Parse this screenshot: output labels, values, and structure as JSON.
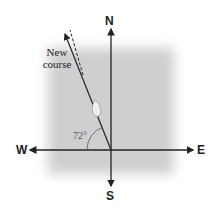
{
  "compass": {
    "north": "N",
    "south": "S",
    "east": "E",
    "west": "W"
  },
  "course": {
    "label_line1": "New",
    "label_line2": "course",
    "angle_label": "72°",
    "angle_deg": 72
  },
  "colors": {
    "line": "#222222",
    "shade": "#cfcfcf",
    "arc": "#555555"
  }
}
